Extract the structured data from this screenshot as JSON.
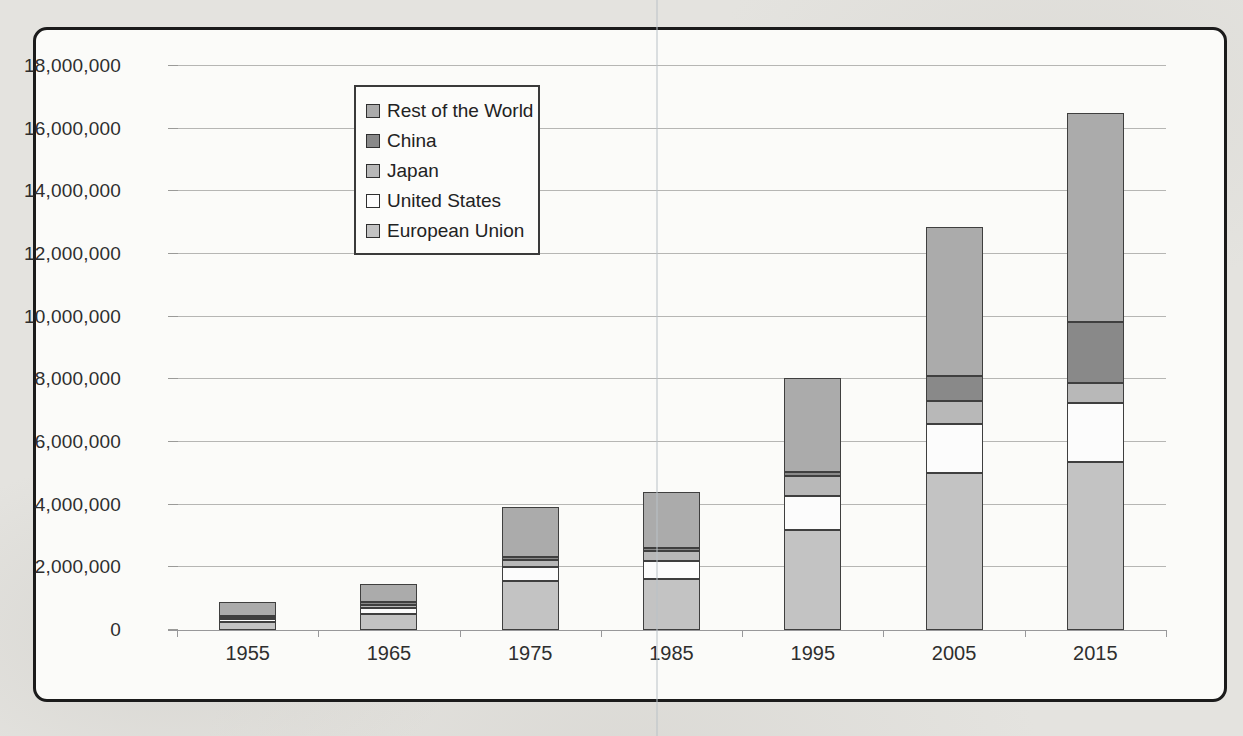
{
  "chart_data": {
    "type": "bar",
    "stacked": true,
    "title": "",
    "xlabel": "",
    "ylabel": "",
    "categories": [
      "1955",
      "1965",
      "1975",
      "1985",
      "1995",
      "2005",
      "2015"
    ],
    "series": [
      {
        "name": "European Union",
        "color": "#c3c3c3",
        "values": [
          250000,
          510000,
          1570000,
          1630000,
          3200000,
          5000000,
          5350000
        ]
      },
      {
        "name": "United States",
        "color": "#fcfcfc",
        "values": [
          100000,
          180000,
          450000,
          570000,
          1080000,
          1570000,
          1900000
        ]
      },
      {
        "name": "Japan",
        "color": "#b8b8b8",
        "values": [
          30000,
          110000,
          220000,
          320000,
          640000,
          730000,
          640000
        ]
      },
      {
        "name": "China",
        "color": "#898989",
        "values": [
          80000,
          80000,
          80000,
          110000,
          130000,
          820000,
          1950000
        ]
      },
      {
        "name": "Rest of the World",
        "color": "#ababab",
        "values": [
          440000,
          590000,
          1620000,
          1760000,
          3000000,
          4750000,
          6660000
        ]
      }
    ],
    "legend_order": [
      "Rest of the World",
      "China",
      "Japan",
      "United States",
      "European Union"
    ],
    "legend_position": "upper-left-inside",
    "ylim": [
      0,
      18000000
    ],
    "ytick_step": 2000000,
    "ytick_labels": [
      "0",
      "2,000,000",
      "4,000,000",
      "6,000,000",
      "8,000,000",
      "10,000,000",
      "12,000,000",
      "14,000,000",
      "16,000,000",
      "18,000,000"
    ],
    "grid": true
  },
  "colors": {
    "paper": "#e4e3df",
    "chart_background": "#fbfbf9",
    "frame_border": "#1b1b1b",
    "gridline": "#b6b6b4",
    "axis": "#98989a",
    "text": "#2e2e2e",
    "segment_border": "#3f3f3f",
    "scan_line": "#bac1c7"
  }
}
